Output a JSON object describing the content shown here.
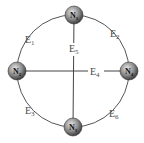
{
  "diagram": {
    "type": "graph",
    "nodes": [
      {
        "id": "N1",
        "label": "N",
        "sub": "1",
        "x": 74,
        "y": 15
      },
      {
        "id": "N2",
        "label": "N",
        "sub": "2",
        "x": 17,
        "y": 71
      },
      {
        "id": "N3",
        "label": "N",
        "sub": "3",
        "x": 73,
        "y": 127
      },
      {
        "id": "N4",
        "label": "N",
        "sub": "4",
        "x": 129,
        "y": 71
      }
    ],
    "edges": [
      {
        "id": "E1",
        "label": "E",
        "sub": "1",
        "from": "N1",
        "to": "N2",
        "shape": "arc",
        "lx": 27,
        "ly": 40
      },
      {
        "id": "E2",
        "label": "E",
        "sub": "2",
        "from": "N1",
        "to": "N4",
        "shape": "arc",
        "lx": 111,
        "ly": 35
      },
      {
        "id": "E3",
        "label": "E",
        "sub": "3",
        "from": "N2",
        "to": "N3",
        "shape": "arc",
        "lx": 26,
        "ly": 113
      },
      {
        "id": "E4",
        "label": "E",
        "sub": "4",
        "from": "N2",
        "to": "N4",
        "shape": "line",
        "lx": 92,
        "ly": 76
      },
      {
        "id": "E5",
        "label": "E",
        "sub": "5",
        "from": "N1",
        "to": "N3",
        "shape": "line",
        "lx": 70,
        "ly": 53
      },
      {
        "id": "E6",
        "label": "E",
        "sub": "6",
        "from": "N4",
        "to": "N3",
        "shape": "arc",
        "lx": 110,
        "ly": 116
      }
    ],
    "colors": {
      "edge": "#555555",
      "node_fill_light": "#d8d8d8",
      "node_fill_dark": "#5a5a5a",
      "label": "#4a4a4a"
    }
  }
}
